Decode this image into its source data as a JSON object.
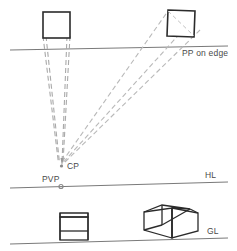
{
  "diagram": {
    "background_color": "#ffffff",
    "canvas": {
      "width": 237,
      "height": 251
    },
    "palette": {
      "object_outline": "#2b2b2b",
      "reference_line": "#7a7a7a",
      "sight_line": "#b9b9b9",
      "projector_line": "#a9a9a9",
      "label_text": "#4a4a4a",
      "point_marker": "#8a8a8a"
    },
    "labels": {
      "pp_on_edge": "PP on edge",
      "cp": "CP",
      "pvp": "PVP",
      "hl": "HL",
      "gl": "GL"
    },
    "reference_lines": [
      {
        "name": "picture-plane-line",
        "label": "PP on edge",
        "x1": 10,
        "y1": 50,
        "x2": 228,
        "y2": 46
      },
      {
        "name": "horizon-line",
        "label": "HL",
        "x1": 10,
        "y1": 188,
        "x2": 228,
        "y2": 182
      },
      {
        "name": "ground-line",
        "label": "GL",
        "x1": 10,
        "y1": 244,
        "x2": 228,
        "y2": 238
      }
    ],
    "points": [
      {
        "name": "cp",
        "label": "CP",
        "x": 61,
        "y": 165
      },
      {
        "name": "pvp",
        "label": "PVP",
        "x": 61,
        "y": 186
      }
    ],
    "plan_shapes": [
      {
        "name": "plan-square-parallel",
        "description": "square in plan, faces parallel to picture plane",
        "corners": [
          [
            43,
            12
          ],
          [
            70,
            12
          ],
          [
            70,
            38
          ],
          [
            43,
            38
          ]
        ],
        "rotated": false
      },
      {
        "name": "plan-square-rotated",
        "description": "square in plan, rotated relative to picture plane",
        "corners": [
          [
            168,
            10
          ],
          [
            195,
            11
          ],
          [
            194,
            37
          ],
          [
            167,
            36
          ]
        ],
        "rotated": true
      }
    ],
    "perspective_views": [
      {
        "name": "one-point-cube",
        "description": "cube drawn in one-point perspective above the ground line",
        "front_face": [
          [
            60,
            213
          ],
          [
            88,
            213
          ],
          [
            88,
            240
          ],
          [
            60,
            240
          ]
        ]
      },
      {
        "name": "two-point-cube",
        "description": "cube drawn in two-point perspective above the ground line",
        "front_vertical_top": [
          172,
          208
        ],
        "front_vertical_bottom": [
          172,
          238
        ]
      }
    ],
    "sight_line_count": 3,
    "projector_line_count": 4
  }
}
